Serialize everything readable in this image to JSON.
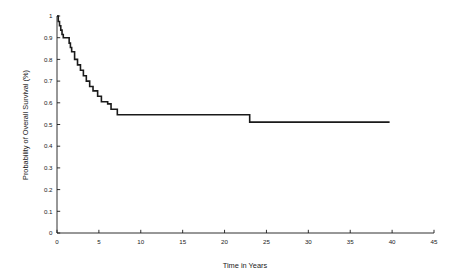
{
  "chart_data": {
    "type": "line",
    "subtype": "kaplan-meier-step",
    "title": "",
    "xlabel": "Time in Years",
    "ylabel": "Probability of Overall Survival (%)",
    "xlim": [
      0,
      45
    ],
    "ylim": [
      0,
      1
    ],
    "grid": false,
    "legend": null,
    "xticks": [
      "0",
      "5",
      "10",
      "15",
      "20",
      "25",
      "30",
      "35",
      "40",
      "45"
    ],
    "xtick_values": [
      0,
      5,
      10,
      15,
      20,
      25,
      30,
      35,
      40,
      45
    ],
    "yticks": [
      "0",
      "0.1",
      "0.2",
      "0.3",
      "0.4",
      "0.5",
      "0.6",
      "0.7",
      "0.8",
      "0.9",
      "1"
    ],
    "ytick_values": [
      0,
      0.1,
      0.2,
      0.3,
      0.4,
      0.5,
      0.6,
      0.7,
      0.8,
      0.9,
      1
    ],
    "series": [
      {
        "name": "Overall Survival",
        "color": "#1a1a1a",
        "line_width": 1.6,
        "steps": [
          [
            0.0,
            1.0
          ],
          [
            0.15,
            0.975
          ],
          [
            0.3,
            0.955
          ],
          [
            0.45,
            0.935
          ],
          [
            0.6,
            0.915
          ],
          [
            0.75,
            0.9
          ],
          [
            1.35,
            0.9
          ],
          [
            1.45,
            0.875
          ],
          [
            1.6,
            0.855
          ],
          [
            1.75,
            0.835
          ],
          [
            2.0,
            0.835
          ],
          [
            2.1,
            0.8
          ],
          [
            2.35,
            0.8
          ],
          [
            2.45,
            0.775
          ],
          [
            2.7,
            0.775
          ],
          [
            2.8,
            0.75
          ],
          [
            3.05,
            0.75
          ],
          [
            3.15,
            0.725
          ],
          [
            3.4,
            0.725
          ],
          [
            3.5,
            0.7
          ],
          [
            3.8,
            0.7
          ],
          [
            3.9,
            0.675
          ],
          [
            4.2,
            0.675
          ],
          [
            4.3,
            0.655
          ],
          [
            4.75,
            0.655
          ],
          [
            4.85,
            0.63
          ],
          [
            5.2,
            0.63
          ],
          [
            5.3,
            0.605
          ],
          [
            5.95,
            0.605
          ],
          [
            6.05,
            0.595
          ],
          [
            6.35,
            0.595
          ],
          [
            6.45,
            0.57
          ],
          [
            7.1,
            0.57
          ],
          [
            7.2,
            0.545
          ],
          [
            22.9,
            0.545
          ],
          [
            23.0,
            0.511
          ],
          [
            39.7,
            0.511
          ]
        ]
      }
    ]
  },
  "axes": {
    "x_axis_name": "time-axis",
    "y_axis_name": "survival-axis"
  }
}
